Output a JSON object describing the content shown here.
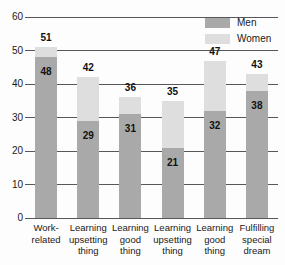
{
  "chart_data": {
    "type": "bar",
    "subtype": "stacked-bar",
    "title": "",
    "subtitle": "",
    "xlabel": "",
    "ylabel": "",
    "ylim": [
      0,
      60
    ],
    "ytick_values": [
      60,
      50,
      40,
      30,
      20,
      10,
      0
    ],
    "ytick_labels": [
      "60",
      "50",
      "40",
      "30",
      "20",
      "10",
      "0"
    ],
    "grid": true,
    "legend_position": "top-right",
    "categories": [
      "Work-related",
      "Learning upsetting thing",
      "Learning good thing",
      "Learning upsetting thing",
      "Learning good thing",
      "Fulfilling special dream"
    ],
    "category_lines": [
      [
        "Work-",
        "related"
      ],
      [
        "Learning",
        "upsetting",
        "thing"
      ],
      [
        "Learning",
        "good",
        "thing"
      ],
      [
        "Learning",
        "upsetting",
        "thing"
      ],
      [
        "Learning",
        "good",
        "thing"
      ],
      [
        "Fulfilling",
        "special",
        "dream"
      ]
    ],
    "series": [
      {
        "name": "Men",
        "color": "#a9a9a9",
        "values": [
          48,
          29,
          31,
          21,
          32,
          38
        ]
      },
      {
        "name": "Women",
        "color": "#dedede",
        "values": [
          51,
          42,
          36,
          35,
          47,
          43
        ]
      }
    ],
    "total_labels": [
      "51",
      "42",
      "36",
      "35",
      "47",
      "43"
    ],
    "men_labels": [
      "48",
      "29",
      "31",
      "21",
      "32",
      "38"
    ]
  },
  "legend": {
    "items": [
      {
        "label": "Men",
        "color": "#a9a9a9"
      },
      {
        "label": "Women",
        "color": "#dedede"
      }
    ]
  },
  "axis": {
    "y_labels": [
      "60",
      "50",
      "40",
      "30",
      "20",
      "10",
      "0"
    ]
  }
}
